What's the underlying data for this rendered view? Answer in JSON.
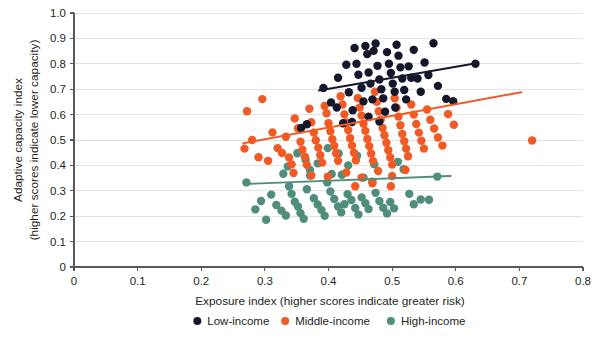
{
  "chart_data": {
    "type": "scatter",
    "title": "",
    "xlabel": "Exposure index (higher scores indicate greater risk)",
    "ylabel_line1": "Adaptive capacity index",
    "ylabel_line2": "(higher scores indicate lower capacity)",
    "xlim": [
      0,
      0.8
    ],
    "ylim": [
      0,
      1.0
    ],
    "xticks": [
      "0",
      "0.1",
      "0.2",
      "0.3",
      "0.4",
      "0.5",
      "0.6",
      "0.7",
      "0.8"
    ],
    "xtick_values": [
      0,
      0.1,
      0.2,
      0.3,
      0.4,
      0.5,
      0.6,
      0.7,
      0.8
    ],
    "yticks": [
      "0",
      "0.1",
      "0.2",
      "0.3",
      "0.4",
      "0.5",
      "0.6",
      "0.7",
      "0.8",
      "0.9",
      "1.0"
    ],
    "ytick_values": [
      0,
      0.1,
      0.2,
      0.3,
      0.4,
      0.5,
      0.6,
      0.7,
      0.8,
      0.9,
      1.0
    ],
    "grid": true,
    "grid_axis": "y",
    "legend_position": "bottom",
    "marker_radius": 4.2,
    "colors": {
      "low_income": "#15172b",
      "middle_income": "#f15a24",
      "high_income": "#4f8d7c",
      "gridline": "#e3e3e3",
      "axis": "#58595b",
      "text": "#231f20",
      "background": "#ffffff"
    },
    "series": [
      {
        "name": "Low-income",
        "color": "#15172b",
        "trendline": {
          "x0": 0.385,
          "y0": 0.695,
          "x1": 0.632,
          "y1": 0.802
        },
        "points": [
          [
            0.392,
            0.705
          ],
          [
            0.404,
            0.648
          ],
          [
            0.415,
            0.745
          ],
          [
            0.423,
            0.566
          ],
          [
            0.428,
            0.796
          ],
          [
            0.432,
            0.688
          ],
          [
            0.438,
            0.617
          ],
          [
            0.441,
            0.862
          ],
          [
            0.444,
            0.8
          ],
          [
            0.447,
            0.757
          ],
          [
            0.452,
            0.706
          ],
          [
            0.455,
            0.652
          ],
          [
            0.458,
            0.87
          ],
          [
            0.461,
            0.838
          ],
          [
            0.463,
            0.766
          ],
          [
            0.466,
            0.722
          ],
          [
            0.469,
            0.66
          ],
          [
            0.471,
            0.851
          ],
          [
            0.474,
            0.88
          ],
          [
            0.477,
            0.792
          ],
          [
            0.48,
            0.738
          ],
          [
            0.483,
            0.7
          ],
          [
            0.486,
            0.664
          ],
          [
            0.489,
            0.611
          ],
          [
            0.492,
            0.846
          ],
          [
            0.495,
            0.8
          ],
          [
            0.498,
            0.764
          ],
          [
            0.501,
            0.722
          ],
          [
            0.504,
            0.69
          ],
          [
            0.507,
            0.875
          ],
          [
            0.51,
            0.832
          ],
          [
            0.513,
            0.786
          ],
          [
            0.516,
            0.742
          ],
          [
            0.519,
            0.697
          ],
          [
            0.522,
            0.66
          ],
          [
            0.526,
            0.79
          ],
          [
            0.53,
            0.745
          ],
          [
            0.534,
            0.855
          ],
          [
            0.54,
            0.742
          ],
          [
            0.545,
            0.69
          ],
          [
            0.551,
            0.805
          ],
          [
            0.557,
            0.756
          ],
          [
            0.565,
            0.881
          ],
          [
            0.572,
            0.713
          ],
          [
            0.585,
            0.662
          ],
          [
            0.596,
            0.653
          ],
          [
            0.631,
            0.8
          ],
          [
            0.505,
            0.628
          ],
          [
            0.463,
            0.592
          ],
          [
            0.48,
            0.573
          ],
          [
            0.413,
            0.628
          ],
          [
            0.437,
            0.571
          ],
          [
            0.366,
            0.562
          ],
          [
            0.357,
            0.547
          ]
        ]
      },
      {
        "name": "Middle-income",
        "color": "#f15a24",
        "trendline": {
          "x0": 0.266,
          "y0": 0.487,
          "x1": 0.703,
          "y1": 0.688
        },
        "points": [
          [
            0.272,
            0.613
          ],
          [
            0.296,
            0.661
          ],
          [
            0.28,
            0.5
          ],
          [
            0.268,
            0.466
          ],
          [
            0.29,
            0.432
          ],
          [
            0.305,
            0.418
          ],
          [
            0.312,
            0.53
          ],
          [
            0.32,
            0.468
          ],
          [
            0.327,
            0.449
          ],
          [
            0.333,
            0.513
          ],
          [
            0.338,
            0.431
          ],
          [
            0.342,
            0.404
          ],
          [
            0.347,
            0.585
          ],
          [
            0.352,
            0.546
          ],
          [
            0.356,
            0.493
          ],
          [
            0.359,
            0.462
          ],
          [
            0.363,
            0.434
          ],
          [
            0.366,
            0.402
          ],
          [
            0.37,
            0.623
          ],
          [
            0.373,
            0.57
          ],
          [
            0.377,
            0.529
          ],
          [
            0.38,
            0.499
          ],
          [
            0.384,
            0.47
          ],
          [
            0.387,
            0.44
          ],
          [
            0.39,
            0.411
          ],
          [
            0.394,
            0.634
          ],
          [
            0.397,
            0.605
          ],
          [
            0.4,
            0.566
          ],
          [
            0.403,
            0.534
          ],
          [
            0.406,
            0.503
          ],
          [
            0.409,
            0.477
          ],
          [
            0.412,
            0.448
          ],
          [
            0.415,
            0.418
          ],
          [
            0.419,
            0.672
          ],
          [
            0.422,
            0.64
          ],
          [
            0.425,
            0.601
          ],
          [
            0.428,
            0.569
          ],
          [
            0.431,
            0.539
          ],
          [
            0.434,
            0.507
          ],
          [
            0.437,
            0.478
          ],
          [
            0.44,
            0.45
          ],
          [
            0.443,
            0.42
          ],
          [
            0.446,
            0.665
          ],
          [
            0.449,
            0.628
          ],
          [
            0.452,
            0.596
          ],
          [
            0.455,
            0.564
          ],
          [
            0.458,
            0.536
          ],
          [
            0.461,
            0.504
          ],
          [
            0.464,
            0.476
          ],
          [
            0.467,
            0.447
          ],
          [
            0.47,
            0.417
          ],
          [
            0.473,
            0.69
          ],
          [
            0.476,
            0.65
          ],
          [
            0.479,
            0.613
          ],
          [
            0.482,
            0.58
          ],
          [
            0.485,
            0.547
          ],
          [
            0.488,
            0.519
          ],
          [
            0.491,
            0.489
          ],
          [
            0.494,
            0.46
          ],
          [
            0.497,
            0.431
          ],
          [
            0.5,
            0.403
          ],
          [
            0.504,
            0.664
          ],
          [
            0.507,
            0.627
          ],
          [
            0.51,
            0.592
          ],
          [
            0.513,
            0.558
          ],
          [
            0.516,
            0.524
          ],
          [
            0.519,
            0.495
          ],
          [
            0.522,
            0.466
          ],
          [
            0.525,
            0.436
          ],
          [
            0.53,
            0.64
          ],
          [
            0.534,
            0.6
          ],
          [
            0.538,
            0.563
          ],
          [
            0.542,
            0.529
          ],
          [
            0.546,
            0.497
          ],
          [
            0.55,
            0.466
          ],
          [
            0.555,
            0.62
          ],
          [
            0.56,
            0.58
          ],
          [
            0.566,
            0.545
          ],
          [
            0.572,
            0.51
          ],
          [
            0.579,
            0.478
          ],
          [
            0.588,
            0.602
          ],
          [
            0.597,
            0.56
          ],
          [
            0.72,
            0.498
          ],
          [
            0.345,
            0.37
          ],
          [
            0.373,
            0.36
          ],
          [
            0.399,
            0.356
          ],
          [
            0.428,
            0.372
          ],
          [
            0.452,
            0.352
          ],
          [
            0.478,
            0.378
          ],
          [
            0.5,
            0.358
          ],
          [
            0.521,
            0.382
          ],
          [
            0.469,
            0.33
          ],
          [
            0.498,
            0.318
          ],
          [
            0.442,
            0.318
          ]
        ]
      },
      {
        "name": "High-income",
        "color": "#4f8d7c",
        "trendline": {
          "x0": 0.268,
          "y0": 0.327,
          "x1": 0.592,
          "y1": 0.358
        },
        "points": [
          [
            0.271,
            0.333
          ],
          [
            0.285,
            0.227
          ],
          [
            0.294,
            0.26
          ],
          [
            0.302,
            0.186
          ],
          [
            0.31,
            0.285
          ],
          [
            0.318,
            0.244
          ],
          [
            0.326,
            0.222
          ],
          [
            0.333,
            0.203
          ],
          [
            0.338,
            0.318
          ],
          [
            0.342,
            0.288
          ],
          [
            0.347,
            0.257
          ],
          [
            0.352,
            0.238
          ],
          [
            0.356,
            0.212
          ],
          [
            0.361,
            0.19
          ],
          [
            0.366,
            0.306
          ],
          [
            0.371,
            0.36
          ],
          [
            0.377,
            0.271
          ],
          [
            0.383,
            0.246
          ],
          [
            0.389,
            0.224
          ],
          [
            0.394,
            0.202
          ],
          [
            0.398,
            0.333
          ],
          [
            0.403,
            0.297
          ],
          [
            0.409,
            0.268
          ],
          [
            0.415,
            0.238
          ],
          [
            0.42,
            0.215
          ],
          [
            0.425,
            0.247
          ],
          [
            0.43,
            0.287
          ],
          [
            0.436,
            0.264
          ],
          [
            0.442,
            0.232
          ],
          [
            0.447,
            0.207
          ],
          [
            0.452,
            0.274
          ],
          [
            0.458,
            0.251
          ],
          [
            0.463,
            0.228
          ],
          [
            0.469,
            0.336
          ],
          [
            0.474,
            0.292
          ],
          [
            0.48,
            0.26
          ],
          [
            0.486,
            0.233
          ],
          [
            0.492,
            0.211
          ],
          [
            0.497,
            0.256
          ],
          [
            0.503,
            0.231
          ],
          [
            0.509,
            0.414
          ],
          [
            0.518,
            0.385
          ],
          [
            0.527,
            0.288
          ],
          [
            0.534,
            0.247
          ],
          [
            0.545,
            0.266
          ],
          [
            0.558,
            0.265
          ],
          [
            0.571,
            0.356
          ],
          [
            0.445,
            0.438
          ],
          [
            0.416,
            0.447
          ],
          [
            0.399,
            0.468
          ],
          [
            0.383,
            0.408
          ],
          [
            0.364,
            0.422
          ],
          [
            0.431,
            0.4
          ],
          [
            0.472,
            0.404
          ],
          [
            0.351,
            0.448
          ],
          [
            0.336,
            0.396
          ],
          [
            0.329,
            0.367
          ],
          [
            0.371,
            0.382
          ],
          [
            0.405,
            0.366
          ],
          [
            0.421,
            0.363
          ],
          [
            0.455,
            0.352
          ]
        ]
      }
    ]
  },
  "legend": {
    "items": [
      {
        "label": "Low-income",
        "color": "#15172b"
      },
      {
        "label": "Middle-income",
        "color": "#f15a24"
      },
      {
        "label": "High-income",
        "color": "#4f8d7c"
      }
    ]
  }
}
